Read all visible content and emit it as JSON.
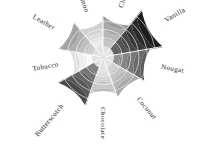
{
  "chart_data": {
    "type": "bar",
    "subtype": "polar-rose",
    "title": "",
    "subtitle": "",
    "xlabel": "",
    "ylabel": "",
    "grid": true,
    "legend": "none",
    "rlim": [
      0,
      10
    ],
    "ring_count": 6,
    "categories": [
      "Clove",
      "Vanilla",
      "Nougat",
      "Coconut",
      "Chocolate",
      "Butterscotch",
      "Tobacco",
      "Leather",
      "Cinnamon"
    ],
    "values": [
      6.1,
      10.0,
      7.4,
      6.4,
      5.6,
      8.2,
      4.6,
      6.9,
      5.1
    ],
    "colors": [
      "#7f7f7f",
      "#1c1c1c",
      "#4d4d4d",
      "#8c8c8c",
      "#9e9e9e",
      "#3c3c3c",
      "#b5b5b5",
      "#878787",
      "#a6a6a6"
    ],
    "start_angle_deg": 90,
    "direction": "clockwise",
    "annotations": []
  },
  "labels": {
    "clove": "Clove",
    "vanilla": "Vanilla",
    "nougat": "Nougat",
    "coconut": "Coconut",
    "chocolate": "Chocolate",
    "butterscotch": "Butterscotch",
    "tobacco": "Tobacco",
    "leather": "Leather",
    "cinnamon": "Cinnamon"
  },
  "colors": {
    "background": "#ffffff",
    "text": "#231f20",
    "separator": "#ffffff"
  }
}
